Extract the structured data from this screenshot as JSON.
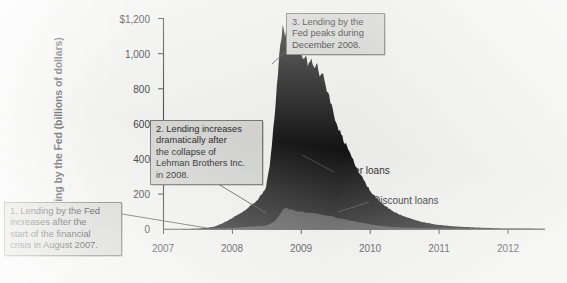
{
  "figure": {
    "background_color": "#f2f2f1",
    "plot_background_color": "#f2f2f1"
  },
  "chart_data": {
    "type": "area",
    "stacked": true,
    "title": "",
    "xlabel": "",
    "ylabel": "Lending by the Fed (billions of dollars)",
    "ylim": [
      0,
      1200
    ],
    "xlim": [
      2007.0,
      2012.6
    ],
    "grid": false,
    "legend_position": "inline-annotation",
    "y_ticks": [
      0,
      200,
      400,
      600,
      800,
      1000,
      1200
    ],
    "y_tick_labels": [
      "0",
      "200",
      "400",
      "600",
      "800",
      "1,000",
      "$1,200"
    ],
    "x_ticks": [
      2007,
      2008,
      2009,
      2010,
      2011,
      2012
    ],
    "x_tick_labels": [
      "2007",
      "2008",
      "2009",
      "2010",
      "2011",
      "2012"
    ],
    "series": [
      {
        "name": "Discount loans",
        "color": "#4c4c4c",
        "x": [
          2007.0,
          2007.25,
          2007.5,
          2007.62,
          2007.75,
          2007.87,
          2008.0,
          2008.12,
          2008.25,
          2008.37,
          2008.5,
          2008.62,
          2008.7,
          2008.75,
          2008.8,
          2008.87,
          2008.92,
          2009.0,
          2009.08,
          2009.17,
          2009.25,
          2009.33,
          2009.42,
          2009.5,
          2009.58,
          2009.67,
          2009.75,
          2009.83,
          2009.92,
          2010.0,
          2010.08,
          2010.17,
          2010.25,
          2010.42,
          2010.6,
          2010.8,
          2011.0,
          2011.3,
          2011.7,
          2012.0,
          2012.6
        ],
        "values": [
          0,
          0,
          1,
          2,
          3,
          4,
          6,
          10,
          14,
          17,
          20,
          40,
          80,
          110,
          118,
          112,
          105,
          100,
          96,
          92,
          88,
          82,
          76,
          70,
          62,
          55,
          48,
          42,
          36,
          30,
          25,
          20,
          16,
          11,
          8,
          6,
          4,
          3,
          2,
          1,
          1
        ]
      },
      {
        "name": "Other loans",
        "color": "#131313",
        "x": [
          2007.0,
          2007.25,
          2007.5,
          2007.62,
          2007.75,
          2007.87,
          2008.0,
          2008.12,
          2008.2,
          2008.25,
          2008.3,
          2008.37,
          2008.42,
          2008.5,
          2008.56,
          2008.62,
          2008.68,
          2008.72,
          2008.75,
          2008.78,
          2008.81,
          2008.84,
          2008.87,
          2008.9,
          2008.93,
          2008.96,
          2009.0,
          2009.04,
          2009.08,
          2009.12,
          2009.17,
          2009.21,
          2009.25,
          2009.29,
          2009.33,
          2009.37,
          2009.42,
          2009.46,
          2009.5,
          2009.58,
          2009.67,
          2009.75,
          2009.83,
          2009.92,
          2010.0,
          2010.08,
          2010.17,
          2010.25,
          2010.42,
          2010.6,
          2010.8,
          2011.0,
          2011.3,
          2011.7,
          2012.0,
          2012.6
        ],
        "values": [
          0,
          0,
          2,
          5,
          12,
          30,
          55,
          80,
          95,
          110,
          125,
          145,
          170,
          210,
          330,
          560,
          820,
          980,
          1025,
          975,
          1005,
          930,
          965,
          900,
          940,
          880,
          905,
          860,
          890,
          840,
          865,
          820,
          850,
          790,
          810,
          740,
          700,
          640,
          580,
          500,
          430,
          370,
          310,
          260,
          210,
          170,
          140,
          115,
          80,
          55,
          35,
          22,
          12,
          6,
          3,
          2
        ]
      }
    ],
    "annotations": [
      {
        "id": "callout-1",
        "text": "1. Lending by the Fed increases after the start of the financial crisis in August 2007.",
        "points_to_year": 2007.62,
        "points_to_value": 3
      },
      {
        "id": "callout-2",
        "text": "2. Lending increases dramatically after the collapse of Lehman Brothers Inc. in 2008.",
        "points_to_year": 2008.58,
        "points_to_value": 330
      },
      {
        "id": "callout-3",
        "text": "3. Lending by the Fed peaks during December 2008.",
        "points_to_year": 2008.96,
        "points_to_value": 1030
      }
    ],
    "series_labels": [
      {
        "id": "other-loans-label",
        "text": "Other loans"
      },
      {
        "id": "discount-loans-label",
        "text": "Discount loans"
      }
    ]
  },
  "callouts": {
    "one": {
      "line1": "1. Lending by the Fed",
      "line2": "increases after the",
      "line3": "start of the financial",
      "line4": "crisis in August 2007."
    },
    "two": {
      "line1": "2. Lending increases",
      "line2": "dramatically after",
      "line3": "the collapse of",
      "line4": "Lehman Brothers Inc.",
      "line5": "in 2008."
    },
    "three": {
      "line1": "3. Lending by the",
      "line2": "Fed peaks during",
      "line3": "December 2008."
    }
  },
  "axis": {
    "y_title": "Lending by the Fed (billions of dollars)",
    "y_labels": [
      "$1,200",
      "1,000",
      "800",
      "600",
      "400",
      "200",
      "0"
    ],
    "x_labels": [
      "2007",
      "2008",
      "2009",
      "2010",
      "2011",
      "2012"
    ]
  },
  "series_labels": {
    "other_loans": "Other loans",
    "discount_loans": "Discount loans"
  }
}
